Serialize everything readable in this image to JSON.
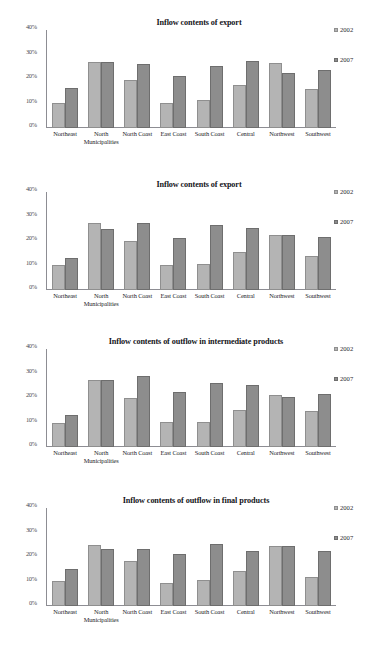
{
  "page": {
    "cropped_header_text": ""
  },
  "legend": {
    "series": [
      {
        "name": "2002",
        "color": "#b4b4b4"
      },
      {
        "name": "2007",
        "color": "#8d8d8d"
      }
    ]
  },
  "axis": {
    "y_ticks": [
      "40%",
      "30%",
      "20%",
      "10%",
      "0%"
    ],
    "categories": [
      {
        "line1": "Northeast",
        "line2": ""
      },
      {
        "line1": "North",
        "line2": "Municipalities"
      },
      {
        "line1": "North Coast",
        "line2": ""
      },
      {
        "line1": "East Coast",
        "line2": ""
      },
      {
        "line1": "South Coast",
        "line2": ""
      },
      {
        "line1": "Central",
        "line2": ""
      },
      {
        "line1": "Northwest",
        "line2": ""
      },
      {
        "line1": "Southwest",
        "line2": ""
      }
    ]
  },
  "chart_data": [
    {
      "type": "bar",
      "title": "Inflow contents of export",
      "xlabel": "",
      "ylabel": "",
      "ylim": [
        0,
        40
      ],
      "grid": false,
      "legend_position": "right",
      "categories": [
        "Northeast",
        "North Municipalities",
        "North Coast",
        "East Coast",
        "South Coast",
        "Central",
        "Northwest",
        "Southwest"
      ],
      "series": [
        {
          "name": "2002",
          "values": [
            10.2,
            27.0,
            19.4,
            10.4,
            11.5,
            17.4,
            26.5,
            15.8
          ]
        },
        {
          "name": "2007",
          "values": [
            16.2,
            27.0,
            26.2,
            21.2,
            25.4,
            27.3,
            22.4,
            23.6
          ]
        }
      ]
    },
    {
      "type": "bar",
      "title": "Inflow contents of export",
      "xlabel": "",
      "ylabel": "",
      "ylim": [
        0,
        40
      ],
      "grid": false,
      "legend_position": "right",
      "categories": [
        "Northeast",
        "North Municipalities",
        "North Coast",
        "East Coast",
        "South Coast",
        "Central",
        "Northwest",
        "Southwest"
      ],
      "series": [
        {
          "name": "2002",
          "values": [
            10.2,
            27.2,
            20.2,
            10.4,
            10.5,
            15.4,
            22.6,
            13.8
          ]
        },
        {
          "name": "2007",
          "values": [
            13.2,
            25.1,
            27.3,
            21.2,
            26.4,
            25.4,
            22.6,
            21.6
          ]
        }
      ]
    },
    {
      "type": "bar",
      "title": "Inflow contents of outflow in intermediate products",
      "xlabel": "",
      "ylabel": "",
      "ylim": [
        0,
        40
      ],
      "grid": false,
      "legend_position": "right",
      "categories": [
        "Northeast",
        "North Municipalities",
        "North Coast",
        "East Coast",
        "South Coast",
        "Central",
        "Northwest",
        "Southwest"
      ],
      "series": [
        {
          "name": "2002",
          "values": [
            10.0,
            27.2,
            20.1,
            10.2,
            10.3,
            15.2,
            21.4,
            14.7
          ]
        },
        {
          "name": "2007",
          "values": [
            13.1,
            27.2,
            29.1,
            22.3,
            26.3,
            25.4,
            20.5,
            21.5
          ]
        }
      ]
    },
    {
      "type": "bar",
      "title": "Inflow contents of outflow in final products",
      "xlabel": "",
      "ylabel": "",
      "ylim": [
        0,
        40
      ],
      "grid": false,
      "legend_position": "right",
      "categories": [
        "Northeast",
        "North Municipalities",
        "North Coast",
        "East Coast",
        "South Coast",
        "Central",
        "Northwest",
        "Southwest"
      ],
      "series": [
        {
          "name": "2002",
          "values": [
            10.4,
            24.9,
            18.5,
            9.4,
            10.6,
            14.4,
            24.5,
            11.7
          ]
        },
        {
          "name": "2007",
          "values": [
            15.1,
            23.1,
            23.2,
            21.2,
            25.2,
            22.3,
            24.5,
            22.4
          ]
        }
      ]
    }
  ]
}
